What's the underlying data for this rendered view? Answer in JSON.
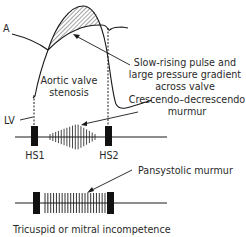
{
  "labels": {
    "aorta": "A",
    "lv": "LV",
    "aortic_stenosis": [
      "Aortic valve",
      "stenosis"
    ],
    "slow_rising": [
      "Slow-rising pulse and",
      "large pressure gradient",
      "across valve"
    ],
    "cresc_decresc": [
      "Crescendo–decrescendo",
      "murmur"
    ],
    "hs1_top": "HS1",
    "hs2_top": "HS2",
    "pansystolic": "Pansystolic murmur",
    "tricuspid": "Tricuspid or mitral incompetence"
  },
  "murmurs": {
    "crescendo_decrescendo": {
      "line_count": 17,
      "profile": "diamond"
    },
    "pansystolic": {
      "line_count": 22,
      "profile": "flat"
    }
  },
  "colors": {
    "ink": "#1a1a1a",
    "text": "#2a2a2a"
  }
}
